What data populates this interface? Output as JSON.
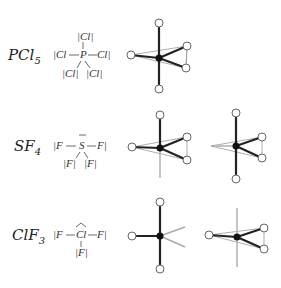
{
  "rows": [
    {
      "formula": {
        "base": "PCl",
        "sub": "5"
      },
      "lewis": {
        "center": "P",
        "top": "|Cl|",
        "left": "|Cl",
        "right": "Cl|",
        "bottom_left": "|Cl|",
        "bottom_right": "|Cl|"
      }
    },
    {
      "formula": {
        "base": "SF",
        "sub": "4"
      },
      "lewis": {
        "center": "S",
        "left": "|F",
        "right": "F|",
        "bottom_left": "|F|",
        "bottom_right": "|F|"
      }
    },
    {
      "formula": {
        "base": "ClF",
        "sub": "3"
      },
      "lewis": {
        "center": "Cl",
        "left": "|F",
        "right": "F|",
        "bottom": "|F|"
      }
    }
  ],
  "colors": {
    "bond": "#222222",
    "lone_pair": "#aaaaaa",
    "outline": "#888888",
    "atom_fill": "#ffffff"
  }
}
